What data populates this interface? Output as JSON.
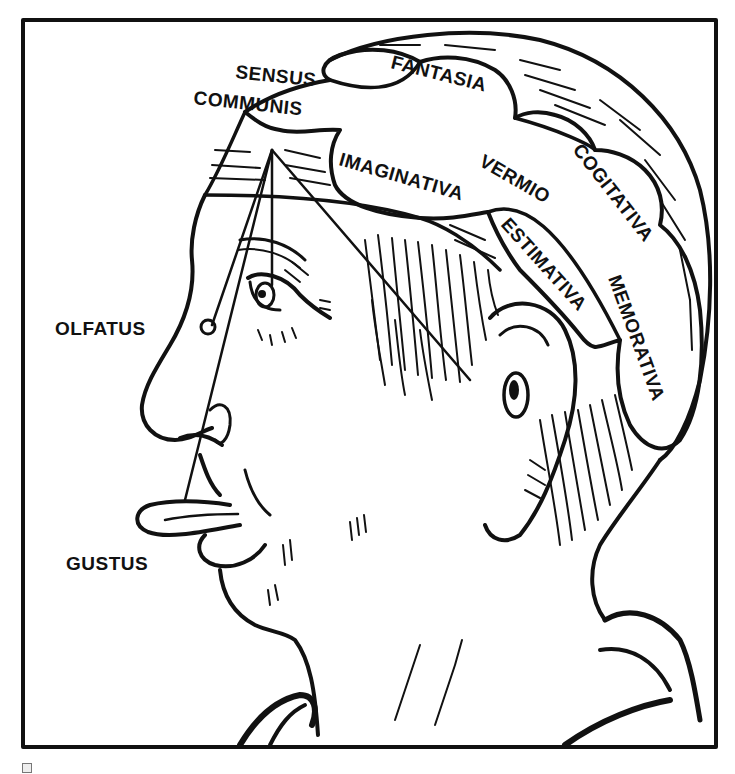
{
  "figure": {
    "ink_color": "#111111",
    "paper_color": "#ffffff"
  },
  "labels": {
    "sensus": "SENSUS",
    "communis": "COMMUNIS",
    "fantasia": "FANTASIA",
    "imaginativa": "IMAGINATIVA",
    "vermio": "VERMIO",
    "cogitativa": "COGITATIVA",
    "estimativa": "ESTIMATIVA",
    "memorativa": "MEMORATIVA",
    "olfatus": "OLFATUS",
    "gustus": "GUSTUS"
  }
}
